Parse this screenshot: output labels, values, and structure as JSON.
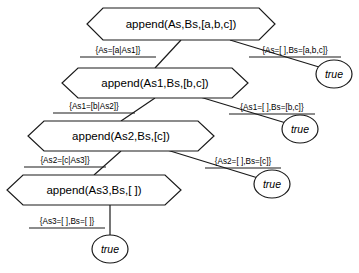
{
  "diagram": {
    "type": "proof-tree",
    "nodes": [
      {
        "id": "goal-0",
        "label": "append(As,Bs,[a,b,c])",
        "shape": "hexagon",
        "cx": 181,
        "cy": 24,
        "w": 188,
        "h": 33
      },
      {
        "id": "goal-1",
        "label": "append(As1,Bs,[b,c])",
        "shape": "hexagon",
        "cx": 155,
        "cy": 83,
        "w": 186,
        "h": 31
      },
      {
        "id": "goal-2",
        "label": "append(As2,Bs,[c])",
        "shape": "hexagon",
        "cx": 121,
        "cy": 136,
        "w": 186,
        "h": 31
      },
      {
        "id": "goal-3",
        "label": "append(As3,Bs,[ ])",
        "shape": "hexagon",
        "cx": 94,
        "cy": 190,
        "w": 174,
        "h": 31
      }
    ],
    "leaves": [
      {
        "id": "true-0",
        "label": "true",
        "cx": 334,
        "cy": 74,
        "rx": 18,
        "ry": 14
      },
      {
        "id": "true-1",
        "label": "true",
        "cx": 300,
        "cy": 129,
        "rx": 18,
        "ry": 14
      },
      {
        "id": "true-2",
        "label": "true",
        "cx": 272,
        "cy": 184,
        "rx": 18,
        "ry": 14
      },
      {
        "id": "true-3",
        "label": "true",
        "cx": 110,
        "cy": 249,
        "rx": 18,
        "ry": 14
      }
    ],
    "edges": [
      {
        "id": "edge-0-left",
        "from": "goal-0",
        "to": "goal-1",
        "x1": 181,
        "y1": 40,
        "x2": 155,
        "y2": 68
      },
      {
        "id": "edge-0-right",
        "from": "goal-0",
        "to": "true-0",
        "x1": 230,
        "y1": 40,
        "x2": 319,
        "y2": 67
      },
      {
        "id": "edge-1-left",
        "from": "goal-1",
        "to": "goal-2",
        "x1": 155,
        "y1": 98,
        "x2": 121,
        "y2": 121
      },
      {
        "id": "edge-1-right",
        "from": "goal-1",
        "to": "true-1",
        "x1": 200,
        "y1": 97,
        "x2": 286,
        "y2": 123
      },
      {
        "id": "edge-2-left",
        "from": "goal-2",
        "to": "goal-3",
        "x1": 121,
        "y1": 151,
        "x2": 94,
        "y2": 175
      },
      {
        "id": "edge-2-right",
        "from": "goal-2",
        "to": "true-2",
        "x1": 167,
        "y1": 150,
        "x2": 258,
        "y2": 178
      },
      {
        "id": "edge-3-down",
        "from": "goal-3",
        "to": "true-3",
        "x1": 110,
        "y1": 205,
        "x2": 110,
        "y2": 236
      }
    ],
    "edge_labels": [
      {
        "id": "label-0-left",
        "text": "{As=[a|As1]}",
        "x": 118,
        "y": 51,
        "underline": true
      },
      {
        "id": "label-0-right",
        "text": "{As=[ ],Bs=[a,b,c]}",
        "x": 295,
        "y": 51,
        "underline": true
      },
      {
        "id": "label-1-left",
        "text": "{As1=[b|As2]}",
        "x": 94,
        "y": 107,
        "underline": true
      },
      {
        "id": "label-1-right",
        "text": "{As1=[ ],Bs=[b,c]}",
        "x": 272,
        "y": 108,
        "underline": true
      },
      {
        "id": "label-2-left",
        "text": "{As2=[c|As3]}",
        "x": 65,
        "y": 161,
        "underline": true
      },
      {
        "id": "label-2-right",
        "text": "{As2=[ ],Bs=[c]}",
        "x": 243,
        "y": 162,
        "underline": true
      },
      {
        "id": "label-3-down",
        "text": "{As3=[ ],Bs=[ ]}",
        "x": 67,
        "y": 222,
        "underline": true
      }
    ],
    "colors": {
      "stroke": "#1a1a1a",
      "fill": "#ffffff",
      "text": "#000000",
      "background": "#ffffff"
    }
  }
}
